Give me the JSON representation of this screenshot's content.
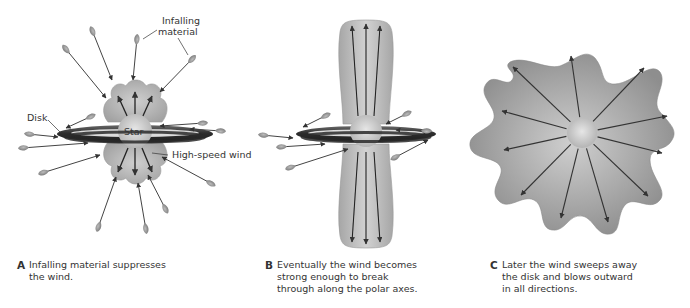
{
  "figure": {
    "panels": [
      {
        "id": "A",
        "labels": {
          "infalling": [
            "Infalling",
            "material"
          ],
          "disk": "Disk",
          "star": "Star",
          "wind": "High-speed wind"
        },
        "caption_letter": "A",
        "caption": "Infalling material suppresses the wind."
      },
      {
        "id": "B",
        "caption_letter": "B",
        "caption": "Eventually the wind becomes strong enough to break through along the polar axes."
      },
      {
        "id": "C",
        "caption_letter": "C",
        "caption": "Later the wind sweeps away the disk and blows outward in all directions."
      }
    ],
    "colors": {
      "wind_fill": "#a8a8a8",
      "disk_dark": "#3a3a3a",
      "arrow": "#333333",
      "blob_fill": "#9a9a9a",
      "background": "#ffffff"
    }
  }
}
